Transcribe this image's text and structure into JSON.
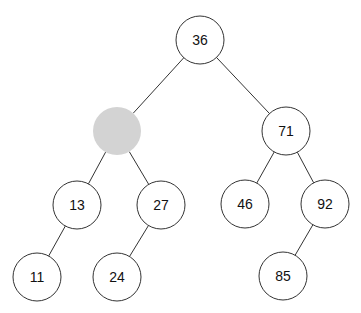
{
  "diagram": {
    "type": "binary-tree",
    "colors": {
      "node_fill": "#ffffff",
      "node_stroke": "#333333",
      "highlight_fill": "#d3d3d3"
    },
    "nodes": [
      {
        "id": "n36",
        "label": "36",
        "highlight": false
      },
      {
        "id": "nblank",
        "label": "",
        "highlight": true
      },
      {
        "id": "n71",
        "label": "71",
        "highlight": false
      },
      {
        "id": "n13",
        "label": "13",
        "highlight": false
      },
      {
        "id": "n27",
        "label": "27",
        "highlight": false
      },
      {
        "id": "n46",
        "label": "46",
        "highlight": false
      },
      {
        "id": "n92",
        "label": "92",
        "highlight": false
      },
      {
        "id": "n11",
        "label": "11",
        "highlight": false
      },
      {
        "id": "n24",
        "label": "24",
        "highlight": false
      },
      {
        "id": "n85",
        "label": "85",
        "highlight": false
      }
    ],
    "edges": [
      {
        "from": "n36",
        "to": "nblank"
      },
      {
        "from": "n36",
        "to": "n71"
      },
      {
        "from": "nblank",
        "to": "n13"
      },
      {
        "from": "nblank",
        "to": "n27"
      },
      {
        "from": "n71",
        "to": "n46"
      },
      {
        "from": "n71",
        "to": "n92"
      },
      {
        "from": "n13",
        "to": "n11"
      },
      {
        "from": "n27",
        "to": "n24"
      },
      {
        "from": "n92",
        "to": "n85"
      }
    ]
  }
}
